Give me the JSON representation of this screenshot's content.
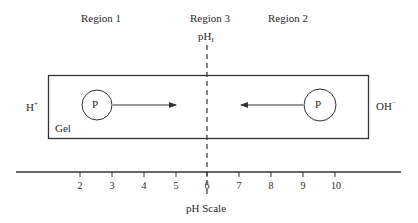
{
  "diagram": {
    "type": "isoelectric-focusing",
    "regions": [
      {
        "id": "region-1",
        "label": "Region 1",
        "x": 108
      },
      {
        "id": "region-3",
        "label": "Region 3",
        "x": 189
      },
      {
        "id": "region-2",
        "label": "Region 2",
        "x": 268
      }
    ],
    "isoelectric_point": {
      "label_main": "pH",
      "label_sub": "I",
      "ph_value": 6
    },
    "electrodes": {
      "anode_side": {
        "label_main": "H",
        "label_sup": "+"
      },
      "cathode_side": {
        "label_main": "OH",
        "label_sup": "−"
      }
    },
    "gel": {
      "label": "Gel"
    },
    "proteins": [
      {
        "id": "protein-left",
        "label": "P",
        "direction": "right"
      },
      {
        "id": "protein-right",
        "label": "P",
        "direction": "left"
      }
    ],
    "axis": {
      "title": "pH Scale",
      "ticks": [
        {
          "label": "2",
          "x": 80
        },
        {
          "label": "3",
          "x": 112
        },
        {
          "label": "4",
          "x": 144
        },
        {
          "label": "5",
          "x": 176
        },
        {
          "label": "6",
          "x": 207
        },
        {
          "label": "7",
          "x": 239
        },
        {
          "label": "8",
          "x": 271
        },
        {
          "label": "9",
          "x": 303
        },
        {
          "label": "10",
          "x": 335
        }
      ]
    },
    "colors": {
      "line": "#333333",
      "text": "#2a2a2a",
      "background": "#ffffff"
    }
  }
}
